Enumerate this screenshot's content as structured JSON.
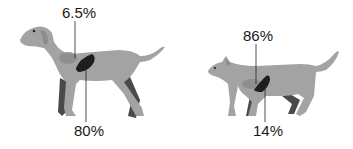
{
  "figure": {
    "animals": [
      {
        "name": "dog",
        "top_label": "6.5%",
        "bottom_label": "80%"
      },
      {
        "name": "cat",
        "top_label": "86%",
        "bottom_label": "14%"
      }
    ]
  },
  "colors": {
    "body": "#a3a3a3",
    "body_dark": "#4a4a4a",
    "organ_light": "#8f8f8f",
    "organ_dark": "#1e1e1e",
    "line": "#222222"
  }
}
